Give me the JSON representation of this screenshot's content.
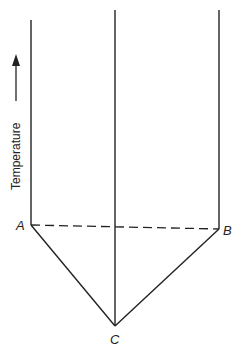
{
  "diagram": {
    "type": "phase-diagram-eutectic",
    "axis_label": "Temperature",
    "axis_arrow_direction": "up",
    "points": {
      "A": {
        "label": "A"
      },
      "B": {
        "label": "B"
      },
      "C": {
        "label": "C"
      }
    },
    "lines": [
      {
        "name": "left-vertical",
        "style": "solid"
      },
      {
        "name": "middle-vertical",
        "style": "solid"
      },
      {
        "name": "right-vertical",
        "style": "solid"
      },
      {
        "name": "A-B",
        "style": "dashed"
      },
      {
        "name": "A-C",
        "style": "solid"
      },
      {
        "name": "C-B",
        "style": "solid"
      }
    ],
    "colors": {
      "line": "#222222",
      "background": "#ffffff"
    }
  }
}
